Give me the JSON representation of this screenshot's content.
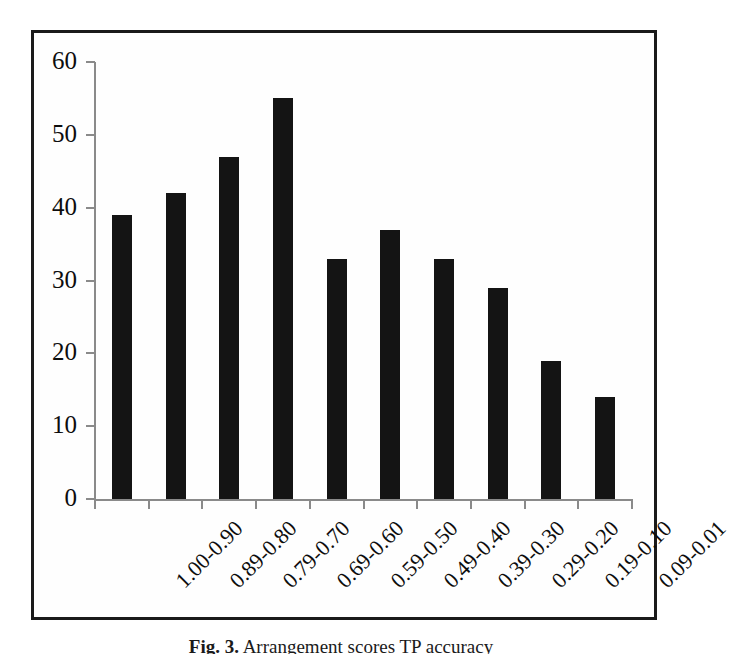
{
  "figure": {
    "caption_label": "Fig. 3.",
    "caption_text": "Arrangement  scores  TP  accuracy"
  },
  "chart_data": {
    "type": "bar",
    "title": "",
    "xlabel": "",
    "ylabel": "",
    "categories": [
      "1.00-0.90",
      "0.89-0.80",
      "0.79-0.70",
      "0.69-0.60",
      "0.59-0.50",
      "0.49-0.40",
      "0.39-0.30",
      "0.29-0.20",
      "0.19-0.10",
      "0.09-0.01"
    ],
    "values": [
      39,
      42,
      47,
      55,
      33,
      37,
      33,
      29,
      19,
      14
    ],
    "ylim": [
      0,
      60
    ],
    "ytick_labels": [
      "0",
      "10",
      "20",
      "30",
      "40",
      "50",
      "60"
    ],
    "yticks": [
      0,
      10,
      20,
      30,
      40,
      50,
      60
    ],
    "grid": false,
    "legend": false,
    "bar_color": "#141414",
    "axis_color": "#8a8a8a",
    "text_color": "#0d0d0d",
    "frame_color": "#1a1a1a",
    "background": "#ffffff"
  }
}
